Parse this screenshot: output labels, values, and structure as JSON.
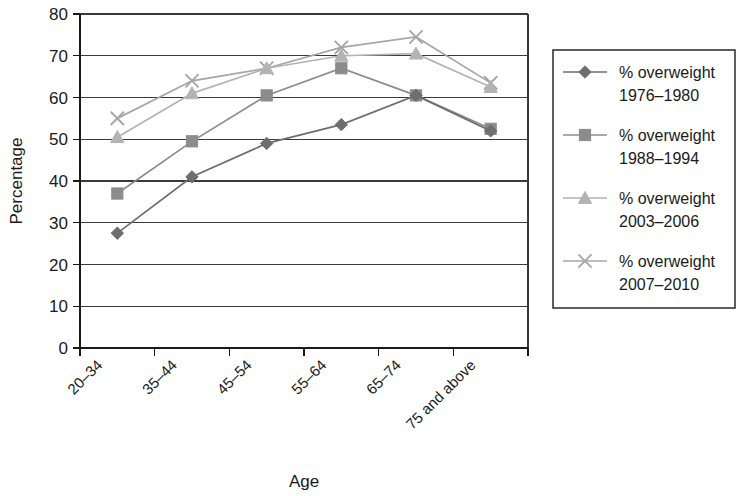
{
  "chart_data": {
    "type": "line",
    "title": "",
    "xlabel": "Age",
    "ylabel": "Percentage",
    "categories": [
      "20–34",
      "35–44",
      "45–54",
      "55–64",
      "65–74",
      "75 and above"
    ],
    "ylim": [
      0,
      80
    ],
    "yticks": [
      0,
      10,
      20,
      30,
      40,
      50,
      60,
      70,
      80
    ],
    "grid": true,
    "legend_position": "right",
    "series": [
      {
        "name": "% overweight 1976–1980",
        "label_line1": "% overweight",
        "label_line2": "1976–1980",
        "marker": "diamond",
        "color": "#6e6e6e",
        "values": [
          27.5,
          41.0,
          49.0,
          53.5,
          60.5,
          52.0
        ]
      },
      {
        "name": "% overweight 1988–1994",
        "label_line1": "% overweight",
        "label_line2": "1988–1994",
        "marker": "square",
        "color": "#8c8c8c",
        "values": [
          37.0,
          49.5,
          60.5,
          67.0,
          60.5,
          52.5
        ]
      },
      {
        "name": "% overweight 2003–2006",
        "label_line1": "% overweight",
        "label_line2": "2003–2006",
        "marker": "triangle",
        "color": "#b3b3b3",
        "values": [
          50.5,
          61.0,
          67.0,
          70.0,
          70.5,
          62.5
        ]
      },
      {
        "name": "% overweight 2007–2010",
        "label_line1": "% overweight",
        "label_line2": "2007–2010",
        "marker": "cross",
        "color": "#a6a6a6",
        "values": [
          55.0,
          64.0,
          67.0,
          72.0,
          74.5,
          63.5
        ]
      }
    ]
  },
  "axes": {
    "y_tick_labels": [
      "80",
      "70",
      "60",
      "50",
      "40",
      "30",
      "20",
      "10",
      "0"
    ],
    "y_axis_title": "Percentage",
    "x_axis_title": "Age"
  },
  "legend": {
    "entries": [
      {
        "line1": "% overweight",
        "line2": "1976–1980"
      },
      {
        "line1": "% overweight",
        "line2": "1988–1994"
      },
      {
        "line1": "% overweight",
        "line2": "2003–2006"
      },
      {
        "line1": "% overweight",
        "line2": "2007–2010"
      }
    ]
  }
}
